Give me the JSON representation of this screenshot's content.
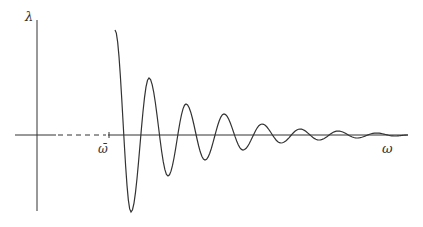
{
  "diagram": {
    "type": "damped-oscillation-plot",
    "y_axis_label": "λ",
    "x_axis_label": "ω",
    "threshold_label": "ω̄",
    "colors": {
      "axes": "#333333",
      "curve": "#333333",
      "background": "#ffffff"
    },
    "curve": {
      "description": "damped oscillation starting at ω̄, decaying amplitude",
      "start": [
        115,
        30
      ],
      "axis_y": 135,
      "extremes": [
        [
          131,
          212
        ],
        [
          149,
          78
        ],
        [
          168,
          176
        ],
        [
          186,
          104
        ],
        [
          205,
          160
        ],
        [
          224,
          114
        ],
        [
          243,
          150
        ],
        [
          262,
          124
        ],
        [
          281,
          143
        ],
        [
          300,
          129
        ],
        [
          319,
          140
        ],
        [
          338,
          131
        ],
        [
          357,
          138
        ],
        [
          376,
          133
        ],
        [
          395,
          136
        ],
        [
          408,
          135
        ]
      ]
    }
  }
}
